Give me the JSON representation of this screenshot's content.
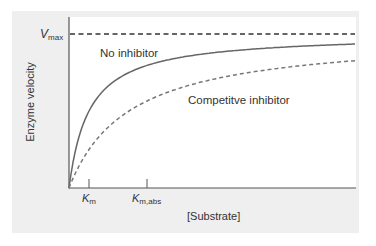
{
  "chart_data": {
    "type": "line",
    "title": "",
    "xlabel": "[Substrate]",
    "ylabel": "Enzyme velocity",
    "grid": false,
    "y_reference": {
      "label": "V_max",
      "style": "dashed",
      "value": 1.0
    },
    "x_ticks": [
      {
        "label": "K_m",
        "value": 1.0
      },
      {
        "label": "K_m,abs",
        "value": 3.9
      }
    ],
    "series": [
      {
        "name": "No inhibitor",
        "style": "solid",
        "km": 1.0,
        "x": [
          0,
          0.5,
          1,
          2,
          3,
          4,
          6,
          8,
          10,
          14.3
        ],
        "values": [
          0,
          0.33,
          0.5,
          0.67,
          0.75,
          0.8,
          0.86,
          0.89,
          0.91,
          0.93
        ]
      },
      {
        "name": "Competitve inhibitor",
        "style": "dashed",
        "km": 3.0,
        "x": [
          0,
          1,
          2,
          3,
          4,
          6,
          8,
          10,
          14.3
        ],
        "values": [
          0,
          0.25,
          0.4,
          0.5,
          0.57,
          0.67,
          0.73,
          0.77,
          0.83
        ]
      }
    ],
    "annotations": [
      "No inhibitor",
      "Competitve inhibitor"
    ]
  },
  "labels": {
    "vmax_main": "V",
    "vmax_sub": "max",
    "km_main": "K",
    "km_sub": "m",
    "kmabs_main": "K",
    "kmabs_sub": "m,abs",
    "xlabel": "[Substrate]",
    "ylabel": "Enzyme velocity",
    "no_inhibitor": "No inhibitor",
    "competitive": "Competitve inhibitor"
  }
}
